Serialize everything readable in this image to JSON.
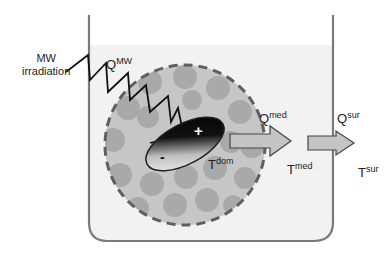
{
  "diagram": {
    "labels": {
      "mw_irradiation_line1": "MW",
      "mw_irradiation_line2": "irradiation",
      "q_mw_base": "Q",
      "q_mw_sup": "MW",
      "q_med_base": "Q",
      "q_med_sup": "med",
      "q_sur_base": "Q",
      "q_sur_sup": "sur",
      "t_dom_base": "T",
      "t_dom_sup": "dom",
      "t_med_base": "T",
      "t_med_sup": "med",
      "t_sur_base": "T",
      "t_sur_sup": "sur",
      "dipole_plus": "+",
      "dipole_minus": "-"
    },
    "colors": {
      "beaker_wall": "#7a7a7a",
      "liquid": "#f2f2f2",
      "domain_fill": "#c6c6c6",
      "domain_dots": "#a9a9a9",
      "domain_border": "#5f5f5f",
      "arrow_fill": "#c4c4c4",
      "arrow_stroke": "#444444",
      "wave": "#111111"
    }
  }
}
